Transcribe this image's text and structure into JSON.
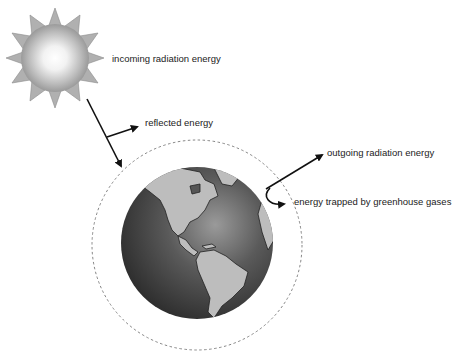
{
  "diagram": {
    "labels": {
      "incoming": "incoming radiation energy",
      "reflected": "reflected energy",
      "outgoing": "outgoing radiation energy",
      "trapped": "energy trapped by greenhouse gases"
    },
    "elements": {
      "sun": "sun-icon",
      "earth": "earth-globe",
      "atmosphere": "dashed-atmosphere-boundary"
    },
    "colors": {
      "arrow": "#111111",
      "land": "#b8b8b8",
      "ocean_dark": "#3a3a3a",
      "sun_rays": "#a8a8a8",
      "dashed": "#777777"
    }
  }
}
